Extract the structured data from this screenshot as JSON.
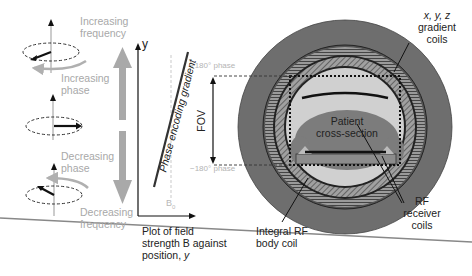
{
  "figure": {
    "topic": "MRI phase encoding",
    "colors": {
      "gray_arrow": "#a9a9a9",
      "outer_ring": "#6e6e6e",
      "gradient_coil_ring": "#8a8a8a",
      "bore_fill": "#d0d0d0",
      "patient_fill": "#7c7c7c",
      "label_gray": "#a8a8a8",
      "label_dark": "#222222"
    }
  },
  "left_panel": {
    "labels": {
      "increasing_frequency": "Increasing\nfrequency",
      "increasing_phase": "Increasing\nphase",
      "decreasing_phase": "Decreasing\nphase",
      "decreasing_frequency": "Decreasing\nfrequency"
    }
  },
  "plot": {
    "y_axis_label": "y",
    "gradient_label": "Phase encoding gradient",
    "b0_label": "B",
    "b0_subscript": "0",
    "caption_line1": "Plot of field",
    "caption_line2": "strength B against",
    "caption_line3_prefix": "position, ",
    "caption_line3_var": "y"
  },
  "scanner": {
    "plus_phase": "+180° phase",
    "minus_phase": "−180° phase",
    "fov_label": "FOV",
    "patient_label_1": "Patient",
    "patient_label_2": "cross-section",
    "gradient_coils_1": "x, y, z",
    "gradient_coils_2": "gradient",
    "gradient_coils_3": "coils",
    "rf_receiver_1": "RF",
    "rf_receiver_2": "receiver",
    "rf_receiver_3": "coils",
    "body_coil_1": "Integral RF",
    "body_coil_2": "body coil"
  }
}
